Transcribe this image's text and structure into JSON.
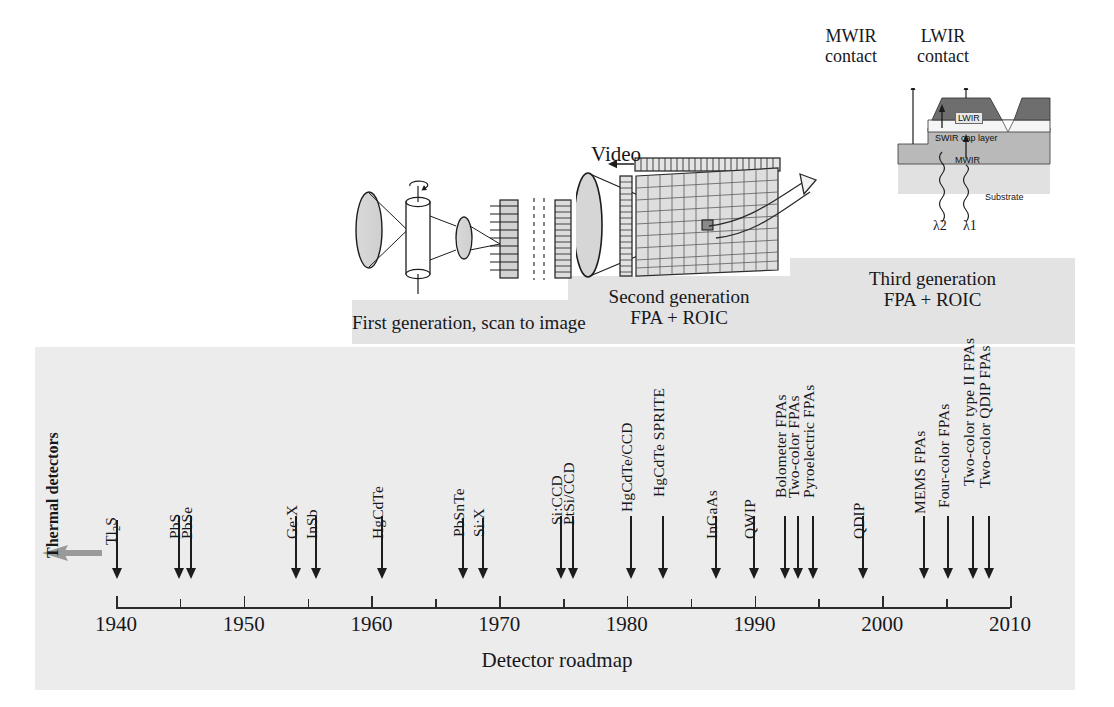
{
  "figure": {
    "axis_title": "Detector roadmap",
    "axis": {
      "start_year": 1940,
      "end_year": 2010,
      "major_ticks": [
        1940,
        1950,
        1960,
        1970,
        1980,
        1990,
        2000,
        2010
      ],
      "minor_ticks": [
        1945,
        1955,
        1965,
        1975,
        1985,
        1995,
        2005
      ],
      "tick_labels": [
        "1940",
        "1950",
        "1960",
        "1970",
        "1980",
        "1990",
        "2000",
        "2010"
      ]
    },
    "thermal_detectors_label": "Thermal detectors",
    "generation_bands": [
      {
        "id": "first",
        "line1": "First generation, scan to image",
        "line2": ""
      },
      {
        "id": "second",
        "line1": "Second generation",
        "line2": "FPA + ROIC"
      },
      {
        "id": "third",
        "line1": "Third generation",
        "line2": "FPA + ROIC"
      }
    ],
    "video_label": "Video",
    "third_gen_diagram": {
      "contacts": [
        {
          "line1": "MWIR",
          "line2": "contact"
        },
        {
          "line1": "LWIR",
          "line2": "contact"
        }
      ],
      "layers": [
        "LWIR",
        "SWIR cap layer",
        "MWIR",
        "Substrate"
      ],
      "wavelengths": [
        "λ2",
        "λ1"
      ]
    }
  },
  "chart_data": {
    "type": "timeline",
    "title": "Detector roadmap",
    "xlabel": "Detector roadmap",
    "xlim": [
      1940,
      2010
    ],
    "x_major_ticks": [
      1940,
      1950,
      1960,
      1970,
      1980,
      1990,
      2000,
      2010
    ],
    "x_minor_ticks": [
      1945,
      1955,
      1965,
      1975,
      1985,
      1995,
      2005
    ],
    "events": [
      {
        "label": "Tl2S",
        "display": "Tl₂S",
        "year": 1940,
        "x": 116,
        "stem": 58,
        "lbl_y": 525
      },
      {
        "label": "PbS",
        "display": "PbS",
        "year": 1945,
        "x": 178,
        "stem": 62,
        "lbl_y": 521
      },
      {
        "label": "PbSe",
        "display": "PbSe",
        "year": 1946,
        "x": 190,
        "stem": 62,
        "lbl_y": 521
      },
      {
        "label": "Ge:X",
        "display": "Ge:X",
        "year": 1954,
        "x": 295,
        "stem": 62,
        "lbl_y": 521
      },
      {
        "label": "InSb",
        "display": "InSb",
        "year": 1955,
        "x": 315,
        "stem": 62,
        "lbl_y": 521
      },
      {
        "label": "HgCdTe",
        "display": "HgCdTe",
        "year": 1960,
        "x": 381,
        "stem": 62,
        "lbl_y": 521
      },
      {
        "label": "PbSnTe",
        "display": "PbSnTe",
        "year": 1966,
        "x": 462,
        "stem": 60,
        "lbl_y": 519
      },
      {
        "label": "Si:X",
        "display": "Si:X",
        "year": 1968,
        "x": 482,
        "stem": 60,
        "lbl_y": 519
      },
      {
        "label": "Si:CCD",
        "display": "Si:CCD",
        "year": 1974,
        "x": 560,
        "stem": 62,
        "lbl_y": 507
      },
      {
        "label": "PtSi/CCD",
        "display": "PtSi/CCD",
        "year": 1974,
        "x": 572,
        "stem": 62,
        "lbl_y": 507
      },
      {
        "label": "HgCdTe/CCD",
        "display": "HgCdTe/CCD",
        "year": 1979,
        "x": 630,
        "stem": 62,
        "lbl_y": 494
      },
      {
        "label": "HgCdTe SPRITE",
        "display": "HgCdTe SPRITE",
        "year": 1981,
        "x": 662,
        "stem": 62,
        "lbl_y": 479
      },
      {
        "label": "InGaAs",
        "display": "InGaAs",
        "year": 1985,
        "x": 715,
        "stem": 62,
        "lbl_y": 521
      },
      {
        "label": "QWIP",
        "display": "QWIP",
        "year": 1987,
        "x": 753,
        "stem": 62,
        "lbl_y": 521
      },
      {
        "label": "Bolometer FPAs",
        "display": "Bolometer FPAs",
        "year": 1990,
        "x": 784,
        "stem": 62,
        "lbl_y": 480
      },
      {
        "label": "Two-color FPAs",
        "display": "Two-color FPAs",
        "year": 1991,
        "x": 797,
        "stem": 62,
        "lbl_y": 480
      },
      {
        "label": "Pyroelectric FPAs",
        "display": "Pyroelectric FPAs",
        "year": 1992,
        "x": 812,
        "stem": 62,
        "lbl_y": 480
      },
      {
        "label": "QDIP",
        "display": "QDIP",
        "year": 1996,
        "x": 862,
        "stem": 62,
        "lbl_y": 521
      },
      {
        "label": "MEMS FPAs",
        "display": "MEMS FPAs",
        "year": 2000,
        "x": 923,
        "stem": 62,
        "lbl_y": 496
      },
      {
        "label": "Four-color FPAs",
        "display": "Four-color FPAs",
        "year": 2002,
        "x": 947,
        "stem": 62,
        "lbl_y": 490
      },
      {
        "label": "Two-color type II FPAs",
        "display": "Two-color type II FPAs",
        "year": 2004,
        "x": 972,
        "stem": 62,
        "lbl_y": 468
      },
      {
        "label": "Two-color QDIP FPAs",
        "display": "Two-color QDIP FPAs",
        "year": 2005,
        "x": 988,
        "stem": 62,
        "lbl_y": 470
      }
    ],
    "annotations": [
      "Thermal detectors",
      "First generation, scan to image",
      "Second generation FPA + ROIC",
      "Third generation FPA + ROIC",
      "Video",
      "MWIR contact",
      "LWIR contact"
    ]
  }
}
